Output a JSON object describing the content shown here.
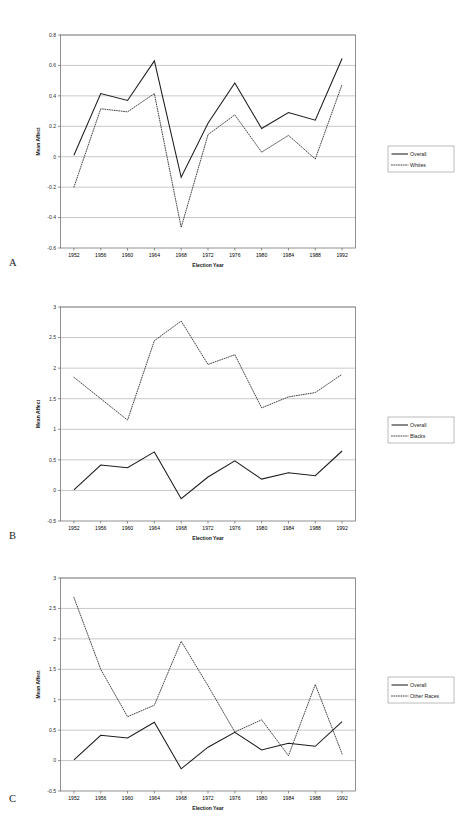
{
  "figure": {
    "title": "PARTY RELEVANCE OVER TIME",
    "panel_labels": {
      "a": "A",
      "b": "B",
      "c": "C"
    }
  },
  "axis_titles": {
    "x": "Election Year",
    "y": "Mean Affect"
  },
  "chart_data": [
    {
      "panel": "A",
      "type": "line",
      "title": "PARTY RELEVANCE OVER TIME",
      "xlabel": "Election Year",
      "ylabel": "Mean Affect",
      "x": [
        1952,
        1956,
        1960,
        1964,
        1968,
        1972,
        1976,
        1980,
        1984,
        1988,
        1992
      ],
      "xticklabels": [
        "1952",
        "1956",
        "1960",
        "1964",
        "1968",
        "1972",
        "1976",
        "1980",
        "1984",
        "1988",
        "1992"
      ],
      "ylim": [
        -0.6,
        0.8
      ],
      "yticks": [
        -0.6,
        -0.4,
        -0.2,
        0,
        0.2,
        0.4,
        0.6,
        0.8
      ],
      "yticklabels": [
        "-0.6",
        "-0.4",
        "-0.2",
        "0",
        "0.2",
        "0.4",
        "0.6",
        "0.8"
      ],
      "grid": true,
      "legend_position": "right",
      "series": [
        {
          "name": "Overall",
          "style": "solid",
          "values": [
            0.01,
            0.415,
            0.37,
            0.63,
            -0.135,
            0.22,
            0.485,
            0.185,
            0.29,
            0.24,
            0.645
          ]
        },
        {
          "name": "Whites",
          "style": "dotted",
          "values": [
            -0.2,
            0.315,
            0.295,
            0.415,
            -0.465,
            0.145,
            0.275,
            0.03,
            0.14,
            -0.015,
            0.475
          ]
        }
      ]
    },
    {
      "panel": "B",
      "type": "line",
      "xlabel": "Election Year",
      "ylabel": "Mean Affect",
      "x": [
        1952,
        1956,
        1960,
        1964,
        1968,
        1972,
        1976,
        1980,
        1984,
        1988,
        1992
      ],
      "xticklabels": [
        "1952",
        "1956",
        "1960",
        "1964",
        "1968",
        "1972",
        "1976",
        "1980",
        "1984",
        "1988",
        "1992"
      ],
      "ylim": [
        -0.5,
        3
      ],
      "yticks": [
        -0.5,
        0,
        0.5,
        1,
        1.5,
        2,
        2.5,
        3
      ],
      "yticklabels": [
        "-0.5",
        "0",
        "0.5",
        "1",
        "1.5",
        "2",
        "2.5",
        "3"
      ],
      "grid": true,
      "legend_position": "right",
      "series": [
        {
          "name": "Overall",
          "style": "solid",
          "values": [
            0.01,
            0.415,
            0.37,
            0.63,
            -0.135,
            0.22,
            0.485,
            0.185,
            0.29,
            0.24,
            0.645
          ]
        },
        {
          "name": "Blacks",
          "style": "dotted",
          "values": [
            1.85,
            1.5,
            1.15,
            2.45,
            2.77,
            2.06,
            2.22,
            1.35,
            1.53,
            1.6,
            1.9
          ]
        }
      ]
    },
    {
      "panel": "C",
      "type": "line",
      "xlabel": "Election Year",
      "ylabel": "Mean Affect",
      "x": [
        1952,
        1956,
        1960,
        1964,
        1968,
        1972,
        1976,
        1980,
        1984,
        1988,
        1992
      ],
      "xticklabels": [
        "1952",
        "1956",
        "1960",
        "1964",
        "1968",
        "1972",
        "1976",
        "1980",
        "1984",
        "1988",
        "1992"
      ],
      "ylim": [
        -0.5,
        3
      ],
      "yticks": [
        -0.5,
        0,
        0.5,
        1,
        1.5,
        2,
        2.5,
        3
      ],
      "yticklabels": [
        "-0.5",
        "0",
        "0.5",
        "1",
        "1.5",
        "2",
        "2.5",
        "3"
      ],
      "grid": true,
      "legend_position": "right",
      "series": [
        {
          "name": "Overall",
          "style": "solid",
          "values": [
            0.01,
            0.415,
            0.37,
            0.63,
            -0.135,
            0.22,
            0.465,
            0.175,
            0.285,
            0.235,
            0.64
          ]
        },
        {
          "name": "Other Races",
          "style": "dotted",
          "values": [
            2.68,
            1.5,
            0.72,
            0.91,
            1.96,
            1.23,
            0.47,
            0.67,
            0.08,
            1.25,
            0.11
          ]
        }
      ]
    }
  ]
}
